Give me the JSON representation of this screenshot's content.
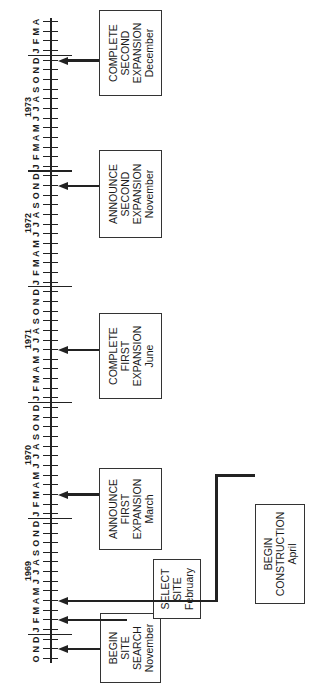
{
  "diagram": {
    "type": "timeline",
    "orientation": "rotated-90-ccw",
    "months_sequence": [
      "O",
      "N",
      "D",
      "J",
      "F",
      "M",
      "A",
      "M",
      "J",
      "J",
      "A",
      "S",
      "O",
      "N",
      "D",
      "J",
      "F",
      "M",
      "A",
      "M",
      "J",
      "J",
      "A",
      "S",
      "O",
      "N",
      "D",
      "J",
      "F",
      "M",
      "A",
      "M",
      "J",
      "J",
      "A",
      "S",
      "O",
      "N",
      "D",
      "J",
      "F",
      "M",
      "A",
      "M",
      "J",
      "J",
      "A",
      "S",
      "O",
      "N",
      "D",
      "J",
      "F",
      "M",
      "A",
      "M",
      "J",
      "J",
      "A",
      "S",
      "O",
      "N",
      "D",
      "J",
      "F",
      "M",
      "A"
    ],
    "start": "October 1968",
    "end": "April 1974",
    "years": [
      {
        "label": "1969",
        "month_index": 3
      },
      {
        "label": "1970",
        "month_index": 15
      },
      {
        "label": "1971",
        "month_index": 27
      },
      {
        "label": "1972",
        "month_index": 39
      },
      {
        "label": "1973",
        "month_index": 51
      }
    ],
    "year_dividers": [
      3,
      15,
      27,
      39,
      51,
      63
    ],
    "events": [
      {
        "id": "begin-site-search",
        "lines": [
          "BEGIN",
          "SITE",
          "SEARCH",
          "November"
        ],
        "month_index": 1,
        "date": "November 1968"
      },
      {
        "id": "select-site",
        "lines": [
          "SELECT",
          "SITE",
          "February"
        ],
        "month_index": 4,
        "date": "February 1969"
      },
      {
        "id": "begin-construction",
        "lines": [
          "BEGIN",
          "CONSTRUCTION",
          "April"
        ],
        "month_index": 6,
        "date": "April 1969"
      },
      {
        "id": "announce-first-expansion",
        "lines": [
          "ANNOUNCE",
          "FIRST",
          "EXPANSION",
          "March"
        ],
        "month_index": 17,
        "date": "March 1970"
      },
      {
        "id": "complete-first-expansion",
        "lines": [
          "COMPLETE",
          "FIRST",
          "EXPANSION",
          "June"
        ],
        "month_index": 32,
        "date": "June 1971"
      },
      {
        "id": "announce-second-expansion",
        "lines": [
          "ANNOUNCE",
          "SECOND",
          "EXPANSION",
          "November"
        ],
        "month_index": 49,
        "date": "November 1972"
      },
      {
        "id": "complete-second-expansion",
        "lines": [
          "COMPLETE",
          "SECOND",
          "EXPANSION",
          "December"
        ],
        "month_index": 62,
        "date": "December 1973"
      }
    ]
  },
  "labels": {
    "y1969": "1969",
    "y1970": "1970",
    "y1971": "1971",
    "y1972": "1972",
    "y1973": "1973",
    "e0": [
      "BEGIN",
      "SITE",
      "SEARCH",
      "November"
    ],
    "e1": [
      "SELECT",
      "SITE",
      "February"
    ],
    "e2": [
      "BEGIN",
      "CONSTRUCTION",
      "April"
    ],
    "e3": [
      "ANNOUNCE",
      "FIRST",
      "EXPANSION",
      "March"
    ],
    "e4": [
      "COMPLETE",
      "FIRST",
      "EXPANSION",
      "June"
    ],
    "e5": [
      "ANNOUNCE",
      "SECOND",
      "EXPANSION",
      "November"
    ],
    "e6": [
      "COMPLETE",
      "SECOND",
      "EXPANSION",
      "December"
    ]
  }
}
